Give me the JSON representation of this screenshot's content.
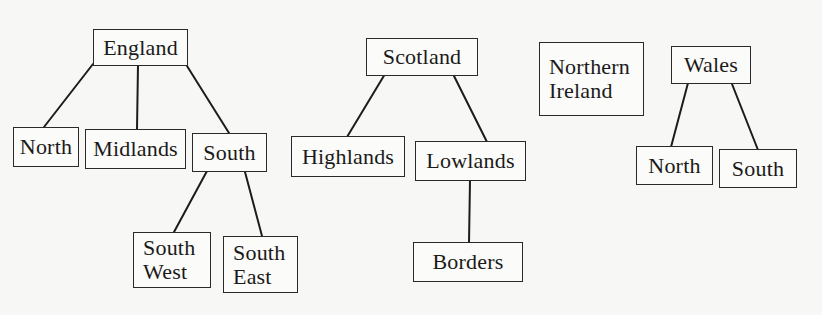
{
  "diagram": {
    "type": "hierarchy",
    "trees": [
      {
        "root": "England",
        "children": [
          {
            "label": "North"
          },
          {
            "label": "Midlands"
          },
          {
            "label": "South",
            "children": [
              {
                "label": "South West",
                "lines": [
                  "South",
                  "West"
                ]
              },
              {
                "label": "South East",
                "lines": [
                  "South",
                  "East"
                ]
              }
            ]
          }
        ]
      },
      {
        "root": "Scotland",
        "children": [
          {
            "label": "Highlands"
          },
          {
            "label": "Lowlands",
            "children": [
              {
                "label": "Borders"
              }
            ]
          }
        ]
      },
      {
        "root": "Northern Ireland",
        "lines": [
          "Northern",
          "Ireland"
        ],
        "children": []
      },
      {
        "root": "Wales",
        "children": [
          {
            "label": "North"
          },
          {
            "label": "South"
          }
        ]
      }
    ]
  },
  "nodes": {
    "england": "England",
    "england_north": "North",
    "england_midlands": "Midlands",
    "england_south": "South",
    "south_west_1": "South",
    "south_west_2": "West",
    "south_east_1": "South",
    "south_east_2": "East",
    "scotland": "Scotland",
    "highlands": "Highlands",
    "lowlands": "Lowlands",
    "borders": "Borders",
    "northern_ireland_1": "Northern",
    "northern_ireland_2": "Ireland",
    "wales": "Wales",
    "wales_north": "North",
    "wales_south": "South"
  },
  "colors": {
    "background": "#f7f7f5",
    "line": "#1c1c1c",
    "box_border": "#2a2a2a"
  }
}
